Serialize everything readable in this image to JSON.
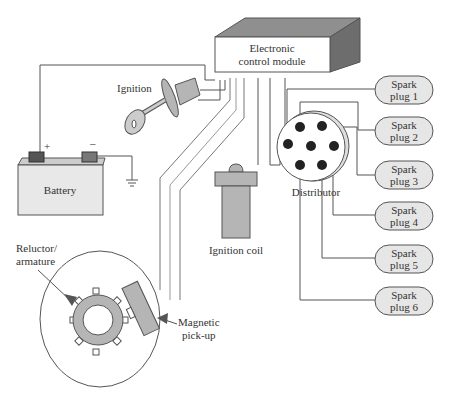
{
  "diagram": {
    "ecm": {
      "line1": "Electronic",
      "line2": "control module"
    },
    "ignition": {
      "label": "Ignition"
    },
    "battery": {
      "label": "Battery",
      "plus": "+",
      "minus": "–"
    },
    "ignition_coil": {
      "label": "Ignition coil"
    },
    "distributor": {
      "label": "Distributor"
    },
    "reluctor": {
      "line1": "Reluctor/",
      "line2": "armature"
    },
    "pickup": {
      "line1": "Magnetic",
      "line2": "pick-up"
    },
    "spark_plugs": [
      {
        "line1": "Spark",
        "line2": "plug 1"
      },
      {
        "line1": "Spark",
        "line2": "plug 2"
      },
      {
        "line1": "Spark",
        "line2": "plug 3"
      },
      {
        "line1": "Spark",
        "line2": "plug 4"
      },
      {
        "line1": "Spark",
        "line2": "plug 5"
      },
      {
        "line1": "Spark",
        "line2": "plug 6"
      }
    ],
    "colors": {
      "component_fill": "#b5b5b5",
      "plug_fill": "#e6e6e6",
      "wire": "#555555",
      "box_top": "#8f8f8f",
      "box_side": "#6d6d6d"
    }
  }
}
